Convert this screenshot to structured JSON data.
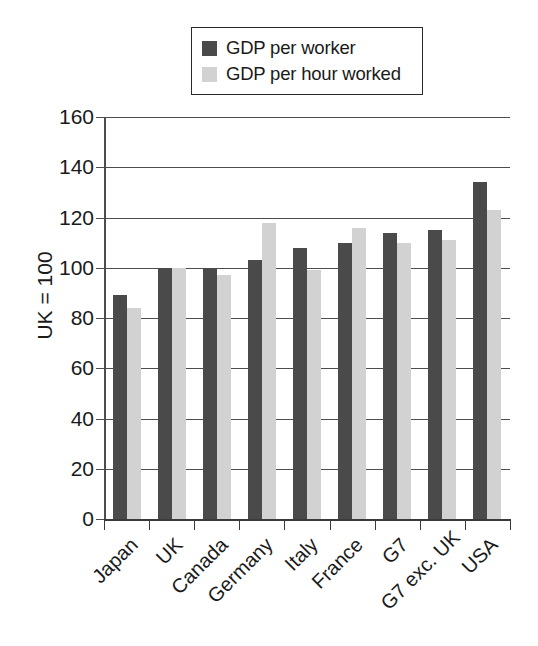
{
  "chart_data": {
    "type": "bar",
    "title": "",
    "subtitle": "",
    "xlabel": "",
    "ylabel": "UK = 100",
    "ylim": [
      0,
      160
    ],
    "yticks": [
      0,
      20,
      40,
      60,
      80,
      100,
      120,
      140,
      160
    ],
    "ytick_labels": [
      "0",
      "20",
      "40",
      "60",
      "80",
      "100",
      "120",
      "140",
      "160"
    ],
    "grid": "horizontal",
    "legend_position": "top-center",
    "categories": [
      "Japan",
      "UK",
      "Canada",
      "Germany",
      "Italy",
      "France",
      "G7",
      "G7 exc. UK",
      "USA"
    ],
    "series": [
      {
        "name": "GDP per worker",
        "color": "#4a4a4a",
        "values": [
          89,
          100,
          100,
          103,
          108,
          110,
          114,
          115,
          134
        ]
      },
      {
        "name": "GDP per hour worked",
        "color": "#d2d2d2",
        "values": [
          84,
          100,
          97,
          118,
          99,
          116,
          110,
          111,
          123
        ]
      }
    ]
  },
  "legend": {
    "entries": [
      {
        "label": "GDP per worker",
        "color": "#4a4a4a"
      },
      {
        "label": "GDP per hour worked",
        "color": "#d2d2d2"
      }
    ]
  },
  "axes": {
    "y_title": "UK = 100",
    "y_tick_labels": [
      "160",
      "140",
      "120",
      "100",
      "80",
      "60",
      "40",
      "20",
      "0"
    ],
    "x_tick_labels": [
      "Japan",
      "UK",
      "Canada",
      "Germany",
      "Italy",
      "France",
      "G7",
      "G7 exc. UK",
      "USA"
    ]
  }
}
